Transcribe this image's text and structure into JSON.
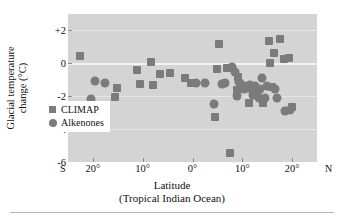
{
  "chart_data": {
    "type": "scatter",
    "title": "",
    "xlabel": "Latitude",
    "xlabel_sub": "(Tropical Indian Ocean)",
    "ylabel_line1": "Glacial temperature",
    "ylabel_line2": "change (°C)",
    "ylim": [
      -6,
      3
    ],
    "yticks": [
      {
        "value": 2,
        "label": "+2"
      },
      {
        "value": 0,
        "label": "0"
      },
      {
        "value": -2,
        "label": "-2"
      },
      {
        "value": -4,
        "label": "-4"
      },
      {
        "value": -6,
        "label": "-6"
      }
    ],
    "xlim": [
      -25,
      25
    ],
    "xticks": [
      {
        "value": -20,
        "label": "20°"
      },
      {
        "value": -10,
        "label": "10°"
      },
      {
        "value": 0,
        "label": "0°"
      },
      {
        "value": 10,
        "label": "10°"
      },
      {
        "value": 20,
        "label": "20°"
      }
    ],
    "x_axis_start_label": "S",
    "x_axis_end_label": "N",
    "grid": true,
    "legend_position": "center-left-lower",
    "plot_background": "#d4d4d4",
    "marker_color": "#7b7b7b",
    "series": [
      {
        "name": "CLIMAP",
        "marker": "square",
        "points": [
          [
            -22.6,
            0.45
          ],
          [
            -20.2,
            -3.2
          ],
          [
            -18.6,
            -3.2
          ],
          [
            -15.2,
            -1.5
          ],
          [
            -15.6,
            -2.05
          ],
          [
            -11.2,
            -0.4
          ],
          [
            -10.6,
            -1.25
          ],
          [
            -8.4,
            0.1
          ],
          [
            -8.0,
            -1.3
          ],
          [
            -6.6,
            -0.65
          ],
          [
            -4.6,
            -0.6
          ],
          [
            -1.6,
            -0.9
          ],
          [
            -0.4,
            -1.2
          ],
          [
            4.6,
            -3.25
          ],
          [
            5.4,
            1.15
          ],
          [
            5.0,
            -0.35
          ],
          [
            7.0,
            -0.3
          ],
          [
            7.6,
            -5.45
          ],
          [
            9.2,
            -0.85
          ],
          [
            9.0,
            -1.65
          ],
          [
            10.4,
            -1.35
          ],
          [
            11.4,
            -2.4
          ],
          [
            14.2,
            -2.4
          ],
          [
            15.4,
            1.35
          ],
          [
            15.6,
            0.0
          ],
          [
            16.4,
            0.6
          ],
          [
            16.0,
            -1.45
          ],
          [
            17.6,
            1.5
          ],
          [
            18.4,
            0.25
          ],
          [
            19.4,
            0.3
          ],
          [
            20.0,
            -2.65
          ]
        ]
      },
      {
        "name": "Alkenones",
        "marker": "circle",
        "points": [
          [
            -19.6,
            -1.1
          ],
          [
            -17.6,
            -1.2
          ],
          [
            -20.4,
            -2.15
          ],
          [
            0.8,
            -1.2
          ],
          [
            2.6,
            -1.2
          ],
          [
            4.4,
            -2.45
          ],
          [
            8.0,
            -0.25
          ],
          [
            8.6,
            -0.5
          ],
          [
            9.4,
            -1.15
          ],
          [
            9.0,
            -2.0
          ],
          [
            10.0,
            -1.3
          ],
          [
            10.4,
            -1.55
          ],
          [
            11.0,
            -1.5
          ],
          [
            11.6,
            -1.3
          ],
          [
            12.0,
            -1.55
          ],
          [
            12.6,
            -1.4
          ],
          [
            12.2,
            -1.9
          ],
          [
            13.0,
            -1.75
          ],
          [
            13.6,
            -1.55
          ],
          [
            13.4,
            -2.1
          ],
          [
            14.0,
            -0.9
          ],
          [
            14.6,
            -2.1
          ],
          [
            15.0,
            -1.35
          ],
          [
            16.6,
            -1.55
          ],
          [
            17.0,
            -2.1
          ],
          [
            18.6,
            -2.9
          ],
          [
            19.6,
            -2.85
          ],
          [
            6.6,
            -1.2
          ],
          [
            6.0,
            -1.25
          ]
        ]
      }
    ],
    "legend": [
      {
        "label": "CLIMAP",
        "marker": "square"
      },
      {
        "label": "Alkenones",
        "marker": "circle"
      }
    ]
  }
}
